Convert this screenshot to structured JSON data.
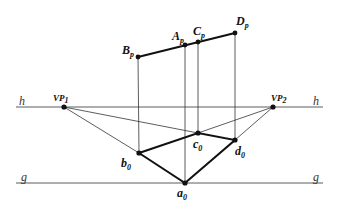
{
  "diagram": {
    "type": "two-point perspective construction",
    "lines": {
      "horizon": {
        "label": "h",
        "y": 107,
        "x1": 16,
        "x2": 323
      },
      "ground": {
        "label": "g",
        "y": 183,
        "x1": 16,
        "x2": 323
      }
    },
    "vanishing_points": [
      {
        "id": "VP1",
        "label": "VP",
        "sub": "1",
        "x": 64,
        "y": 107
      },
      {
        "id": "VP2",
        "label": "VP",
        "sub": "2",
        "x": 273,
        "y": 107
      }
    ],
    "plan_points": [
      {
        "id": "a0",
        "label": "a",
        "sub": "0",
        "x": 185,
        "y": 183
      },
      {
        "id": "b0",
        "label": "b",
        "sub": "0",
        "x": 139,
        "y": 153
      },
      {
        "id": "c0",
        "label": "c",
        "sub": "0",
        "x": 198,
        "y": 133
      },
      {
        "id": "d0",
        "label": "d",
        "sub": "0",
        "x": 235,
        "y": 140
      }
    ],
    "projected_points": [
      {
        "id": "Ap",
        "label": "A",
        "sub": "p",
        "x": 185,
        "y": 45
      },
      {
        "id": "Bp",
        "label": "B",
        "sub": "p",
        "x": 138,
        "y": 57
      },
      {
        "id": "Cp",
        "label": "C",
        "sub": "p",
        "x": 198,
        "y": 42
      },
      {
        "id": "Dp",
        "label": "D",
        "sub": "p",
        "x": 235,
        "y": 33
      }
    ]
  }
}
